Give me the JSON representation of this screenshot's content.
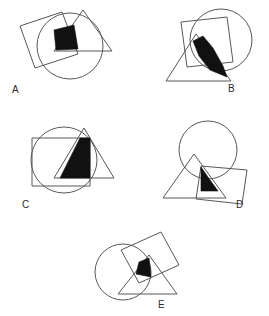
{
  "page": {
    "background_color": "#ffffff",
    "line_color": "#58585a",
    "shade_color": "#111111",
    "width": 269,
    "height": 316,
    "kind": "geometric-overlap-puzzle"
  },
  "figures": [
    {
      "id": "A",
      "label": "A",
      "label_position": "bottom-left",
      "shapes": [
        "circle",
        "square",
        "triangle"
      ],
      "shaded_region": "circle-square-triangle-overlap",
      "shaded_shape_description": "quadrilateral wedge",
      "circle": {
        "cx": 62,
        "cy": 42,
        "r": 33
      },
      "square": {
        "points": "12,22 54,8 70,50 27,64"
      },
      "triangle": {
        "points": "75,6 104,47 46,47"
      },
      "shaded": {
        "points": "46,26 66,21 70,45 48,46"
      }
    },
    {
      "id": "B",
      "label": "B",
      "label_position": "bottom-right",
      "shapes": [
        "circle",
        "square",
        "triangle"
      ],
      "shaded_region": "circle-square-triangle-overlap",
      "shaded_shape_description": "curved sliver",
      "circle": {
        "cx": 66,
        "cy": 34,
        "r": 31
      },
      "square": {
        "points": "26,16 72,11 78,56 32,61"
      },
      "triangle": {
        "points": "41,28 76,75 11,75"
      },
      "shaded": {
        "points": "38,35 48,30 58,42 68,60 72,71 55,64 44,50"
      }
    },
    {
      "id": "C",
      "label": "C",
      "label_position": "bottom-left",
      "shapes": [
        "circle",
        "square",
        "triangle"
      ],
      "shaded_region": "circle-square-triangle-overlap",
      "shaded_shape_description": "tall triangular wedge",
      "circle": {
        "cx": 46,
        "cy": 40,
        "r": 33
      },
      "square": {
        "points": "14,18 72,18 72,66 14,66"
      },
      "triangle": {
        "points": "66,8 96,58 36,58"
      },
      "shaded": {
        "points": "62,18 72,18 72,58 42,58"
      }
    },
    {
      "id": "D",
      "label": "D",
      "label_position": "bottom-right",
      "shapes": [
        "circle",
        "square",
        "triangle"
      ],
      "shaded_region": "circle-square-triangle-overlap",
      "shaded_shape_description": "small triangular wedge",
      "circle": {
        "cx": 56,
        "cy": 30,
        "r": 29
      },
      "square": {
        "points": "49,46 95,50 90,84 44,79"
      },
      "triangle": {
        "points": "42,34 74,78 11,78"
      },
      "shaded": {
        "points": "49,47 58,60 66,71 49,71"
      }
    },
    {
      "id": "E",
      "label": "E",
      "label_position": "bottom-center",
      "shapes": [
        "circle",
        "square",
        "triangle"
      ],
      "shaded_region": "circle-square-triangle-overlap",
      "shaded_shape_description": "small dark triangle",
      "circle": {
        "cx": 38,
        "cy": 44,
        "r": 28
      },
      "square": {
        "points": "36,22 76,4 94,37 54,55"
      },
      "triangle": {
        "points": "64,27 92,66 33,66"
      },
      "shaded": {
        "points": "54,34 64,30 66,49 51,46"
      }
    }
  ]
}
